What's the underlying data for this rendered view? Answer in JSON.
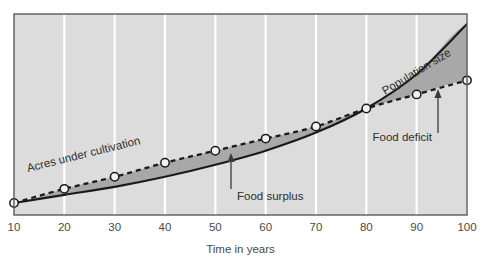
{
  "chart_data": {
    "type": "line",
    "title": "",
    "subtitle": "",
    "xlabel": "Time in years",
    "ylabel": "",
    "xlim": [
      10,
      100
    ],
    "ylim": [
      0,
      100
    ],
    "grid": "vertical-white-gridlines",
    "legend": "inline-curve-labels",
    "x": [
      10,
      20,
      30,
      40,
      50,
      60,
      70,
      80,
      90,
      100
    ],
    "xticklabels": [
      "10",
      "20",
      "30",
      "40",
      "50",
      "60",
      "70",
      "80",
      "90",
      "100"
    ],
    "series": [
      {
        "name": "Population size",
        "style": "solid",
        "markers": false,
        "values": [
          6,
          10,
          14,
          19,
          25,
          32,
          41,
          53,
          70,
          95
        ]
      },
      {
        "name": "Acres under cultivation",
        "style": "dashed",
        "markers": true,
        "values": [
          6,
          13,
          19,
          26,
          32,
          38,
          44,
          53,
          60,
          67
        ]
      }
    ],
    "annotations": [
      {
        "text": "Food surplus",
        "kind": "arrow-up",
        "region": "between curves, left of crossover",
        "x": 53
      },
      {
        "text": "Food deficit",
        "kind": "arrow-up",
        "region": "between curves, right of crossover",
        "x": 94
      },
      {
        "text": "Population size",
        "kind": "curve-label",
        "rotated": true
      },
      {
        "text": "Acres under cultivation",
        "kind": "curve-label",
        "rotated": true
      }
    ],
    "crossover": {
      "x": 80,
      "note": "population size overtakes acres under cultivation"
    },
    "colors": {
      "plot_background": "#dcdcdc",
      "gridline": "#ffffff",
      "frame": "#555555",
      "population_curve": "#1a1a1a",
      "cultivation_curve": "#1a1a1a",
      "fill_between": "#a8a8a8",
      "marker_fill": "#f2f2f2",
      "marker_edge": "#1a1a1a",
      "text": "#3a3a3a"
    }
  }
}
